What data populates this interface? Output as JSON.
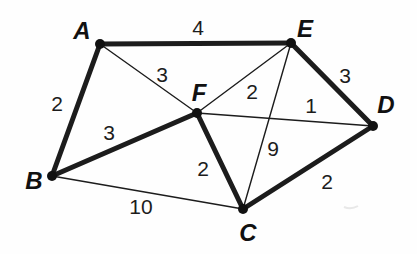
{
  "diagram": {
    "type": "weighted-graph",
    "colors": {
      "background": "#fefefe",
      "edge": "#1c1c1c",
      "node_dot": "#111111",
      "label_text": "#111111",
      "smudge": "#d9d9d9"
    },
    "style": {
      "thick_edge_width": 5,
      "thin_edge_width": 1.4,
      "node_radius": 5
    },
    "nodes": [
      {
        "id": "A",
        "x": 100,
        "y": 44,
        "label": "A",
        "label_x": 82,
        "label_y": 30
      },
      {
        "id": "B",
        "x": 52,
        "y": 176,
        "label": "B",
        "label_x": 34,
        "label_y": 180
      },
      {
        "id": "C",
        "x": 243,
        "y": 209,
        "label": "C",
        "label_x": 248,
        "label_y": 232
      },
      {
        "id": "D",
        "x": 373,
        "y": 126,
        "label": "D",
        "label_x": 386,
        "label_y": 104
      },
      {
        "id": "E",
        "x": 291,
        "y": 43,
        "label": "E",
        "label_x": 305,
        "label_y": 28
      },
      {
        "id": "F",
        "x": 197,
        "y": 113,
        "label": "F",
        "label_x": 199,
        "label_y": 92
      }
    ],
    "edges": [
      {
        "from": "A",
        "to": "E",
        "weight": "4",
        "bold": true,
        "label_x": 198,
        "label_y": 27
      },
      {
        "from": "A",
        "to": "B",
        "weight": "2",
        "bold": true,
        "label_x": 57,
        "label_y": 103
      },
      {
        "from": "A",
        "to": "F",
        "weight": "3",
        "bold": false,
        "label_x": 162,
        "label_y": 74
      },
      {
        "from": "E",
        "to": "D",
        "weight": "3",
        "bold": true,
        "label_x": 345,
        "label_y": 75
      },
      {
        "from": "E",
        "to": "F",
        "weight": "2",
        "bold": false,
        "label_x": 252,
        "label_y": 91
      },
      {
        "from": "F",
        "to": "D",
        "weight": "1",
        "bold": false,
        "label_x": 311,
        "label_y": 105
      },
      {
        "from": "B",
        "to": "F",
        "weight": "3",
        "bold": true,
        "label_x": 109,
        "label_y": 132
      },
      {
        "from": "F",
        "to": "C",
        "weight": "2",
        "bold": true,
        "label_x": 203,
        "label_y": 168
      },
      {
        "from": "E",
        "to": "C",
        "weight": "9",
        "bold": false,
        "label_x": 273,
        "label_y": 148
      },
      {
        "from": "C",
        "to": "D",
        "weight": "2",
        "bold": true,
        "label_x": 327,
        "label_y": 181
      },
      {
        "from": "B",
        "to": "C",
        "weight": "10",
        "bold": false,
        "label_x": 141,
        "label_y": 206
      }
    ],
    "artifacts": [
      {
        "name": "scan-smudge",
        "x": 344,
        "y": 207,
        "x2": 358,
        "y2": 206
      }
    ]
  }
}
